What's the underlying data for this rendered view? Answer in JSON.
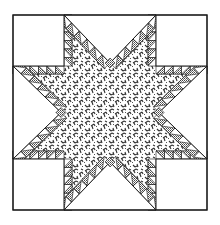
{
  "image": {
    "title": "Feathered Star quilt block",
    "description": "Line illustration of a quilt block: outer square, four blank corner squares, four blank setting triangles, eight-pointed star with leaf-print center and sawtooth (feathered) edges of alternating crosshatched and plain triangles."
  },
  "geometry": {
    "outer": {
      "x": 13,
      "y": 15,
      "w": 194,
      "h": 195
    },
    "corner_size": 51,
    "feather_width": 8,
    "feather_count_per_edge": 6
  },
  "colors": {
    "background": "#ffffff",
    "line": "#1a1a1a",
    "print_ink": "#3a3a3a",
    "crosshatch": "#555555"
  }
}
